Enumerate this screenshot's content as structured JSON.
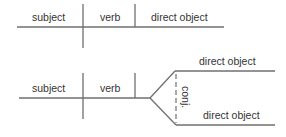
{
  "diagram_top": {
    "name": "simple-sentence-diagram",
    "labels": {
      "subject": "subject",
      "verb": "verb",
      "direct_object": "direct object"
    }
  },
  "diagram_bottom": {
    "name": "compound-direct-object-diagram",
    "labels": {
      "subject": "subject",
      "verb": "verb",
      "direct_object_1": "direct object",
      "direct_object_2": "direct object",
      "conjunction": "conj."
    }
  },
  "colors": {
    "line": "#6f6f6f",
    "text": "#333333",
    "background": "#ffffff"
  }
}
